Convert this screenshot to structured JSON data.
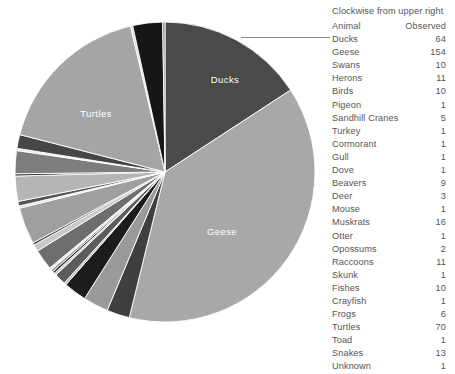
{
  "legend": {
    "title": "Clockwise from upper right",
    "columns": [
      "Animal",
      "Observed"
    ]
  },
  "chart_data": {
    "type": "pie",
    "title": "",
    "start_angle_deg": 0,
    "direction": "clockwise",
    "legend_position": "right",
    "total": 395,
    "labeled_slices": [
      "Ducks",
      "Geese",
      "Turtles"
    ],
    "categories": [
      "Ducks",
      "Geese",
      "Swans",
      "Herons",
      "Birds",
      "Pigeon",
      "Sandhill Cranes",
      "Turkey",
      "Cormorant",
      "Gull",
      "Dove",
      "Beavers",
      "Deer",
      "Mouse",
      "Muskrats",
      "Otter",
      "Opossums",
      "Raccoons",
      "Skunk",
      "Fishes",
      "Crayfish",
      "Frogs",
      "Turtles",
      "Toad",
      "Snakes",
      "Unknown"
    ],
    "values": [
      64,
      154,
      10,
      11,
      10,
      1,
      5,
      1,
      1,
      1,
      1,
      9,
      3,
      1,
      16,
      1,
      2,
      11,
      1,
      10,
      1,
      6,
      70,
      1,
      13,
      1
    ],
    "colors": [
      "#4a4a4a",
      "#a8a8a8",
      "#3f3f3f",
      "#9a9a9a",
      "#1c1c1c",
      "#bdbdbd",
      "#5c5c5c",
      "#d0d0d0",
      "#2a2a2a",
      "#8f8f8f",
      "#f0f0f0",
      "#6e6e6e",
      "#c8c8c8",
      "#3a3a3a",
      "#9f9f9f",
      "#dedede",
      "#545454",
      "#b5b5b5",
      "#2f2f2f",
      "#7d7d7d",
      "#e8e8e8",
      "#464646",
      "#a5a5a5",
      "#d8d8d8",
      "#161616",
      "#8a8a8a"
    ],
    "rows": [
      {
        "animal": "Ducks",
        "observed": 64
      },
      {
        "animal": "Geese",
        "observed": 154
      },
      {
        "animal": "Swans",
        "observed": 10
      },
      {
        "animal": "Herons",
        "observed": 11
      },
      {
        "animal": "Birds",
        "observed": 10
      },
      {
        "animal": "Pigeon",
        "observed": 1
      },
      {
        "animal": "Sandhill Cranes",
        "observed": 5
      },
      {
        "animal": "Turkey",
        "observed": 1
      },
      {
        "animal": "Cormorant",
        "observed": 1
      },
      {
        "animal": "Gull",
        "observed": 1
      },
      {
        "animal": "Dove",
        "observed": 1
      },
      {
        "animal": "Beavers",
        "observed": 9
      },
      {
        "animal": "Deer",
        "observed": 3
      },
      {
        "animal": "Mouse",
        "observed": 1
      },
      {
        "animal": "Muskrats",
        "observed": 16
      },
      {
        "animal": "Otter",
        "observed": 1
      },
      {
        "animal": "Opossums",
        "observed": 2
      },
      {
        "animal": "Raccoons",
        "observed": 11
      },
      {
        "animal": "Skunk",
        "observed": 1
      },
      {
        "animal": "Fishes",
        "observed": 10
      },
      {
        "animal": "Crayfish",
        "observed": 1
      },
      {
        "animal": "Frogs",
        "observed": 6
      },
      {
        "animal": "Turtles",
        "observed": 70
      },
      {
        "animal": "Toad",
        "observed": 1
      },
      {
        "animal": "Snakes",
        "observed": 13
      },
      {
        "animal": "Unknown",
        "observed": 1
      }
    ]
  }
}
